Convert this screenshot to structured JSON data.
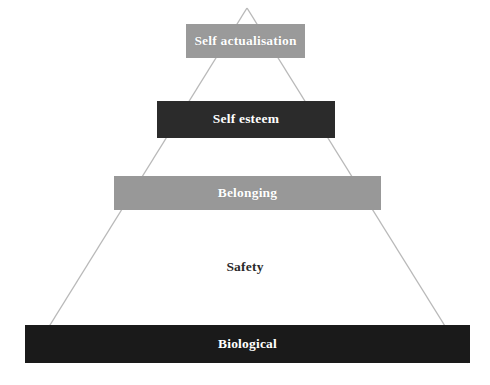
{
  "diagram": {
    "background_color": "#ffffff",
    "outline_color": "#b9b9b9",
    "apex": {
      "x": 247,
      "y": 8
    },
    "base_left": {
      "x": 27,
      "y": 362
    },
    "base_right": {
      "x": 468,
      "y": 363
    },
    "tiers": [
      {
        "id": "self-actualisation",
        "label": "Self actualisation",
        "level": 1,
        "fill_color": "#9a9a9a",
        "text_color": "#ffffff",
        "x": 186,
        "y": 24,
        "width": 119,
        "height": 34
      },
      {
        "id": "self-esteem",
        "label": "Self esteem",
        "level": 2,
        "fill_color": "#2b2b2b",
        "text_color": "#ffffff",
        "x": 157,
        "y": 101,
        "width": 178,
        "height": 37
      },
      {
        "id": "belonging",
        "label": "Belonging",
        "level": 3,
        "fill_color": "#989898",
        "text_color": "#ffffff",
        "x": 114,
        "y": 176,
        "width": 267,
        "height": 34
      },
      {
        "id": "safety",
        "label": "Safety",
        "level": 4,
        "fill_color": "transparent",
        "text_color": "#2a2a2a",
        "x": 70,
        "y": 252,
        "width": 350,
        "height": 30
      },
      {
        "id": "biological",
        "label": "Biological",
        "level": 5,
        "fill_color": "#1a1a1a",
        "text_color": "#ffffff",
        "x": 25,
        "y": 325,
        "width": 445,
        "height": 38
      }
    ]
  }
}
